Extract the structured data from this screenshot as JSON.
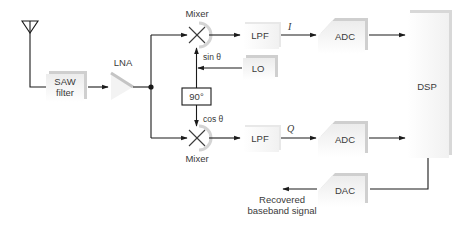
{
  "diagram": {
    "type": "IQ receiver block diagram",
    "colors": {
      "wire": "#1a1a1a",
      "text": "#3a3a3a",
      "block_shadow": "#cfcfcf",
      "block_face_top": "#ececec",
      "block_face_bottom": "#ffffff"
    },
    "icons": {
      "antenna": "antenna-icon"
    },
    "blocks": {
      "saw_filter": {
        "line1": "SAW",
        "line2": "filter"
      },
      "lna": {
        "label": "LNA"
      },
      "mixer_i": {
        "label": "Mixer"
      },
      "mixer_q": {
        "label": "Mixer"
      },
      "lpf_i": {
        "label": "LPF"
      },
      "lpf_q": {
        "label": "LPF"
      },
      "lo": {
        "label": "LO"
      },
      "phase_shifter": {
        "label": "90°"
      },
      "adc_i": {
        "label": "ADC"
      },
      "adc_q": {
        "label": "ADC"
      },
      "dsp": {
        "label": "DSP"
      },
      "dac": {
        "label": "DAC"
      }
    },
    "signals": {
      "i": "I",
      "q": "Q",
      "sin": "sin θ",
      "cos": "cos θ"
    },
    "output": {
      "line1": "Recovered",
      "line2": "baseband signal"
    },
    "connections": [
      [
        "antenna",
        "saw_filter"
      ],
      [
        "saw_filter",
        "lna"
      ],
      [
        "lna",
        "mixer_i"
      ],
      [
        "lna",
        "mixer_q"
      ],
      [
        "lo",
        "mixer_i"
      ],
      [
        "lo",
        "phase_shifter"
      ],
      [
        "phase_shifter",
        "mixer_q"
      ],
      [
        "mixer_i",
        "lpf_i"
      ],
      [
        "mixer_q",
        "lpf_q"
      ],
      [
        "lpf_i",
        "adc_i"
      ],
      [
        "lpf_q",
        "adc_q"
      ],
      [
        "adc_i",
        "dsp"
      ],
      [
        "adc_q",
        "dsp"
      ],
      [
        "dsp",
        "dac"
      ],
      [
        "dac",
        "output"
      ]
    ]
  }
}
